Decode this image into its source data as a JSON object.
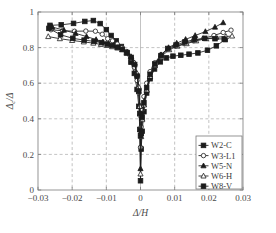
{
  "chart_data": {
    "type": "line",
    "title": "",
    "subtitle": "",
    "xlabel": "Δ/H",
    "ylabel": "Δc/Δ",
    "xlim": [
      -0.03,
      0.03
    ],
    "ylim": [
      0,
      1
    ],
    "xticks": [
      -0.03,
      -0.02,
      -0.01,
      0,
      0.01,
      0.02,
      0.03
    ],
    "xticklabels": [
      "−0.03",
      "−0.02",
      "−0.01",
      "0",
      "0.01",
      "0.02",
      "0.03"
    ],
    "yticks": [
      0,
      0.2,
      0.4,
      0.6,
      0.8,
      1
    ],
    "yticklabels": [
      "0",
      "0.2",
      "0.4",
      "0.6",
      "0.8",
      "1"
    ],
    "grid": true,
    "grid_style": "dashed",
    "legend_position": "lower right",
    "marker_edge_color": "#1c1c1c",
    "line_color": "#1c1c1c",
    "series": [
      {
        "name": "W2-C",
        "marker": "square",
        "fill": "filled",
        "x": [
          -0.0265,
          -0.0232,
          -0.0196,
          -0.0163,
          -0.0138,
          -0.0118,
          -0.01,
          -0.0086,
          -0.0071,
          -0.0056,
          -0.0041,
          -0.0028,
          -0.0018,
          -0.001,
          -0.0005,
          -0.0002,
          0.0,
          0.0002,
          0.0005,
          0.001,
          0.0018,
          0.0028,
          0.0041,
          0.0058,
          0.0076,
          0.0095,
          0.0118,
          0.0142,
          0.0168,
          0.0196,
          0.0222,
          0.0248
        ],
        "y": [
          0.925,
          0.928,
          0.936,
          0.947,
          0.952,
          0.935,
          0.901,
          0.868,
          0.838,
          0.806,
          0.77,
          0.718,
          0.655,
          0.565,
          0.47,
          0.34,
          0.052,
          0.23,
          0.33,
          0.44,
          0.545,
          0.625,
          0.68,
          0.72,
          0.742,
          0.752,
          0.757,
          0.763,
          0.77,
          0.785,
          0.81,
          0.845
        ]
      },
      {
        "name": "W3-L1",
        "marker": "circle",
        "fill": "open",
        "x": [
          -0.0262,
          -0.0228,
          -0.0193,
          -0.016,
          -0.0132,
          -0.0112,
          -0.0096,
          -0.0082,
          -0.0068,
          -0.0054,
          -0.004,
          -0.0028,
          -0.0018,
          -0.001,
          -0.0005,
          -0.0002,
          0.0,
          0.0002,
          0.0005,
          0.001,
          0.0018,
          0.0028,
          0.0042,
          0.006,
          0.008,
          0.0102,
          0.0128,
          0.0155,
          0.0185,
          0.0215,
          0.0242,
          0.0265
        ],
        "y": [
          0.9,
          0.895,
          0.892,
          0.893,
          0.892,
          0.875,
          0.85,
          0.838,
          0.82,
          0.8,
          0.778,
          0.74,
          0.69,
          0.615,
          0.545,
          0.42,
          0.24,
          0.355,
          0.45,
          0.525,
          0.6,
          0.665,
          0.715,
          0.76,
          0.79,
          0.808,
          0.822,
          0.838,
          0.852,
          0.868,
          0.885,
          0.898
        ]
      },
      {
        "name": "W5-N",
        "marker": "triangle-up",
        "fill": "filled",
        "x": [
          -0.0258,
          -0.0224,
          -0.019,
          -0.0158,
          -0.013,
          -0.011,
          -0.0094,
          -0.008,
          -0.0066,
          -0.0052,
          -0.0039,
          -0.0027,
          -0.0017,
          -0.001,
          -0.0005,
          -0.0002,
          0.0,
          0.0002,
          0.0005,
          0.001,
          0.0018,
          0.0028,
          0.0042,
          0.006,
          0.0082,
          0.0106,
          0.0132,
          0.016,
          0.019,
          0.0218,
          0.0242
        ],
        "y": [
          0.915,
          0.898,
          0.88,
          0.862,
          0.845,
          0.832,
          0.82,
          0.812,
          0.8,
          0.79,
          0.772,
          0.748,
          0.712,
          0.65,
          0.572,
          0.47,
          0.12,
          0.315,
          0.4,
          0.48,
          0.56,
          0.635,
          0.7,
          0.76,
          0.8,
          0.825,
          0.846,
          0.868,
          0.89,
          0.915,
          0.94
        ]
      },
      {
        "name": "W6-H",
        "marker": "triangle-up",
        "fill": "open",
        "x": [
          -0.027,
          -0.0236,
          -0.02,
          -0.0166,
          -0.0138,
          -0.0116,
          -0.0098,
          -0.0083,
          -0.0068,
          -0.0054,
          -0.004,
          -0.0028,
          -0.0018,
          -0.001,
          -0.0005,
          -0.0002,
          0.0,
          0.0002,
          0.0005,
          0.001,
          0.0018,
          0.0028,
          0.0042,
          0.0062,
          0.0084,
          0.0108,
          0.0135,
          0.0163,
          0.0192,
          0.0222,
          0.025,
          0.0268
        ],
        "y": [
          0.862,
          0.85,
          0.84,
          0.832,
          0.825,
          0.818,
          0.812,
          0.805,
          0.798,
          0.788,
          0.772,
          0.75,
          0.715,
          0.655,
          0.58,
          0.47,
          0.09,
          0.3,
          0.395,
          0.478,
          0.562,
          0.64,
          0.7,
          0.752,
          0.788,
          0.808,
          0.822,
          0.838,
          0.85,
          0.858,
          0.862,
          0.865
        ]
      },
      {
        "name": "W8-V",
        "marker": "square",
        "fill": "filled",
        "x": [
          -0.0268,
          -0.0234,
          -0.0198,
          -0.0165,
          -0.0136,
          -0.0114,
          -0.0097,
          -0.0082,
          -0.0067,
          -0.0053,
          -0.0039,
          -0.0027,
          -0.0017,
          -0.001,
          -0.0005,
          -0.0002,
          0.0,
          0.0002,
          0.0005,
          0.001,
          0.0018,
          0.0028,
          0.0042,
          0.006,
          0.008,
          0.0104,
          0.013,
          0.0158,
          0.0188,
          0.0218,
          0.0245
        ],
        "y": [
          0.908,
          0.872,
          0.852,
          0.842,
          0.835,
          0.828,
          0.82,
          0.812,
          0.802,
          0.79,
          0.772,
          0.745,
          0.705,
          0.64,
          0.555,
          0.43,
          0.305,
          0.32,
          0.41,
          0.49,
          0.575,
          0.65,
          0.708,
          0.755,
          0.795,
          0.815,
          0.832,
          0.845,
          0.852,
          0.85,
          0.848
        ]
      }
    ]
  },
  "legend": {
    "items": [
      {
        "label": "W2-C"
      },
      {
        "label": "W3-L1"
      },
      {
        "label": "W5-N"
      },
      {
        "label": "W6-H"
      },
      {
        "label": "W8-V"
      }
    ]
  },
  "axes": {
    "x_title": "Δ/H",
    "y_title_numerator": "Δ",
    "y_title_sub": "c",
    "y_title_denominator": "Δ"
  }
}
